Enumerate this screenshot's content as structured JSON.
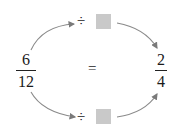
{
  "left_fraction": {
    "numerator": "6",
    "denominator": "12"
  },
  "right_fraction": {
    "numerator": "2",
    "denominator": "4"
  },
  "equals_sign": "=",
  "top_operation": {
    "operator": "÷",
    "operand_box": "blank-box"
  },
  "bottom_operation": {
    "operator": "÷",
    "operand_box": "blank-box"
  },
  "colors": {
    "arrow": "#8a8a8a",
    "box": "#c9c9c9",
    "text": "#1a1a1a"
  }
}
